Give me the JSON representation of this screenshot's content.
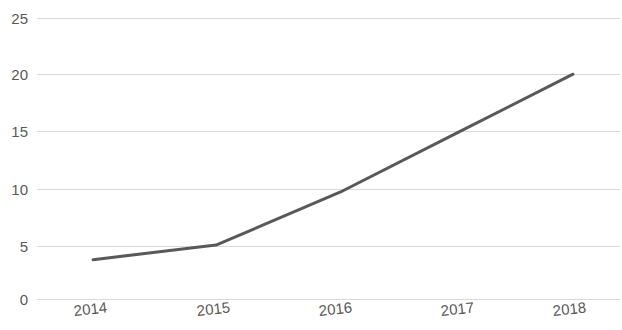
{
  "chart_data": {
    "type": "line",
    "title": "",
    "subtitle": "",
    "xlabel": "",
    "ylabel": "",
    "categories": [
      "2014",
      "2015",
      "2016",
      "2017",
      "2018"
    ],
    "x": [
      2014,
      2015,
      2016,
      2017,
      2018
    ],
    "series": [
      {
        "name": "Series 1",
        "values": [
          3.5,
          4.8,
          9.5,
          15.0,
          20.0
        ],
        "color": "#595959",
        "line_width": 3,
        "markers": false
      }
    ],
    "values": [
      3.5,
      4.8,
      9.5,
      15.0,
      20.0
    ],
    "ylim": [
      0,
      25
    ],
    "yticks": [
      0,
      5,
      10,
      15,
      20,
      25
    ],
    "ytick_labels": [
      "0",
      "5",
      "10",
      "15",
      "20",
      "25"
    ],
    "xtick_labels": [
      "2014",
      "2015",
      "2016",
      "2017",
      "2018"
    ],
    "xtick_rotation_deg": -6,
    "grid": true,
    "grid_axis": "y",
    "grid_color": "#d9d9d9",
    "legend": false,
    "legend_position": "none",
    "background": "#ffffff",
    "tick_label_color": "#595959",
    "annotations": []
  },
  "axes": {
    "y_labels": [
      {
        "text": "25",
        "value": 25,
        "y": 18
      },
      {
        "text": "20",
        "value": 20,
        "y": 74
      },
      {
        "text": "15",
        "value": 15,
        "y": 131
      },
      {
        "text": "10",
        "value": 10,
        "y": 189
      },
      {
        "text": "5",
        "value": 5,
        "y": 246
      },
      {
        "text": "0",
        "value": 0,
        "y": 299
      }
    ],
    "x_labels": [
      {
        "text": "2014",
        "x": 73
      },
      {
        "text": "2015",
        "x": 196
      },
      {
        "text": "2016",
        "x": 318
      },
      {
        "text": "2017",
        "x": 440
      },
      {
        "text": "2018",
        "x": 552
      }
    ]
  }
}
